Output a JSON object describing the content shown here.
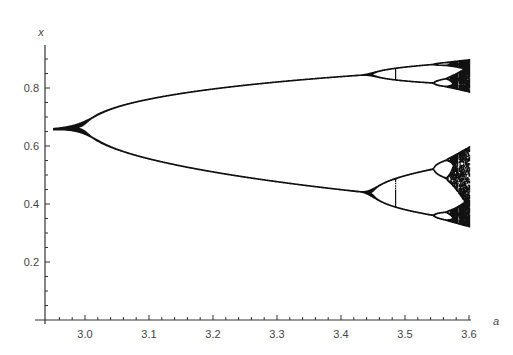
{
  "chart_data": {
    "type": "scatter",
    "title": "",
    "xlabel": "a",
    "ylabel": "x",
    "xlim": [
      2.94,
      3.6
    ],
    "ylim": [
      0.0,
      0.92
    ],
    "x_ticks": [
      3.0,
      3.1,
      3.2,
      3.3,
      3.4,
      3.5,
      3.6
    ],
    "x_tick_labels": [
      "3.0",
      "3.1",
      "3.2",
      "3.3",
      "3.4",
      "3.5",
      "3.6"
    ],
    "x_minor_step": 0.02,
    "y_ticks": [
      0.2,
      0.4,
      0.6,
      0.8
    ],
    "y_tick_labels": [
      "0.2",
      "0.4",
      "0.6",
      "0.8"
    ],
    "y_minor_step": 0.05,
    "grid": false,
    "legend": null,
    "a_start": 2.95,
    "a_end": 3.6,
    "annotations": [
      {
        "a": 3.0,
        "event": "period-2 bifurcation",
        "x": 0.667
      },
      {
        "a": 3.449,
        "event": "period-4 bifurcation",
        "x_upper": 0.84,
        "x_lower": 0.44
      },
      {
        "a": 3.544,
        "event": "period-8 bifurcation"
      },
      {
        "a": 3.57,
        "event": "onset of chaos"
      }
    ],
    "sample_points": [
      {
        "a": 2.95,
        "x": [
          0.661
        ]
      },
      {
        "a": 3.1,
        "x": [
          0.558,
          0.765
        ]
      },
      {
        "a": 3.2,
        "x": [
          0.513,
          0.799
        ]
      },
      {
        "a": 3.3,
        "x": [
          0.479,
          0.824
        ]
      },
      {
        "a": 3.4,
        "x": [
          0.452,
          0.842
        ]
      },
      {
        "a": 3.5,
        "x": [
          0.383,
          0.501,
          0.827,
          0.875
        ]
      },
      {
        "a": 3.6,
        "x_range": [
          0.32,
          0.9
        ]
      }
    ],
    "color": "#111111"
  },
  "axes": {
    "x_label": "a",
    "y_label": "x"
  }
}
